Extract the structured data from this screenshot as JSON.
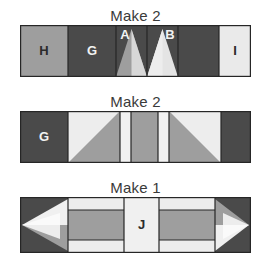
{
  "diagram": {
    "title_row1": "Make 2",
    "title_row2": "Make 2",
    "title_row3": "Make 1",
    "palette": {
      "dark": "#4a4a4a",
      "medium": "#9e9e9e",
      "light": "#e9e9e9",
      "white": "#f4f4f4",
      "outline": "#262626",
      "background": "#ffffff",
      "label_text": "#3a3a3a"
    },
    "rows": [
      {
        "name": "row-1",
        "label": "Make 2",
        "blocks": [
          {
            "name": "block-h",
            "letter": "H",
            "fill": "medium",
            "letter_color": "dark"
          },
          {
            "name": "block-g",
            "letter": "G",
            "fill": "dark",
            "letter_color": "light"
          },
          {
            "name": "block-a",
            "letter": "A",
            "fill": "dark",
            "letter_color": "light"
          },
          {
            "name": "block-b",
            "letter": "B",
            "fill": "dark",
            "letter_color": "light"
          },
          {
            "name": "block-plain-dark",
            "letter": "",
            "fill": "dark",
            "letter_color": "light"
          },
          {
            "name": "block-i",
            "letter": "I",
            "fill": "white",
            "letter_color": "dark"
          }
        ]
      },
      {
        "name": "row-2",
        "label": "Make 2",
        "blocks": [
          {
            "name": "block-g",
            "letter": "G",
            "fill": "dark",
            "letter_color": "light"
          },
          {
            "name": "half-square-triangle-left",
            "letter": "",
            "fill": "light",
            "letter_color": "dark"
          },
          {
            "name": "narrow-strip-left",
            "letter": "",
            "fill": "white",
            "letter_color": "dark"
          },
          {
            "name": "center-bar",
            "letter": "",
            "fill": "medium",
            "letter_color": "dark"
          },
          {
            "name": "narrow-strip-right",
            "letter": "",
            "fill": "white",
            "letter_color": "dark"
          },
          {
            "name": "half-square-triangle-right",
            "letter": "",
            "fill": "light",
            "letter_color": "dark"
          },
          {
            "name": "block-plain-dark",
            "letter": "",
            "fill": "dark",
            "letter_color": "light"
          }
        ]
      },
      {
        "name": "row-3",
        "label": "Make 1",
        "blocks": [
          {
            "name": "arrow-unit-left",
            "letter": "",
            "fill": "dark",
            "letter_color": "light"
          },
          {
            "name": "strip-stack-left",
            "letter": "",
            "fill": "medium",
            "letter_color": "dark"
          },
          {
            "name": "block-j",
            "letter": "J",
            "fill": "white",
            "letter_color": "dark"
          },
          {
            "name": "strip-stack-right",
            "letter": "",
            "fill": "medium",
            "letter_color": "dark"
          },
          {
            "name": "arrow-unit-right",
            "letter": "",
            "fill": "dark",
            "letter_color": "light"
          }
        ]
      }
    ]
  }
}
